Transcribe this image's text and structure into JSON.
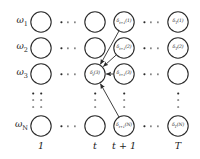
{
  "figure": {
    "type": "trellis-diagram",
    "title": "",
    "stroke_color": "#2a2a2a",
    "background": "#ffffff"
  },
  "row_labels": [
    {
      "id": "w1",
      "text": "ω",
      "sub": "1",
      "y": 22
    },
    {
      "id": "w2",
      "text": "ω",
      "sub": "2",
      "y": 48
    },
    {
      "id": "w3",
      "text": "ω",
      "sub": "3",
      "y": 74
    },
    {
      "id": "wN",
      "text": "ω",
      "sub": "N",
      "y": 126
    }
  ],
  "column_labels": [
    {
      "id": "col-1",
      "text": "1",
      "x": 41
    },
    {
      "id": "col-t",
      "text": "t",
      "x": 95
    },
    {
      "id": "col-t1",
      "text": "t + 1",
      "x": 124
    },
    {
      "id": "col-T",
      "text": "T",
      "x": 178
    }
  ],
  "columns": [
    {
      "id": "col-1",
      "x": 41
    },
    {
      "id": "col-t",
      "x": 95
    },
    {
      "id": "col-t1",
      "x": 124
    },
    {
      "id": "col-T",
      "x": 178
    }
  ],
  "rows": [
    22,
    48,
    74,
    126
  ],
  "node_radius": 10.2,
  "nodes": [
    {
      "id": "n-1-1",
      "col": 0,
      "row": 0,
      "x": 41,
      "y": 22,
      "label": "",
      "sub": ""
    },
    {
      "id": "n-1-2",
      "col": 0,
      "row": 1,
      "x": 41,
      "y": 48,
      "label": "",
      "sub": ""
    },
    {
      "id": "n-1-3",
      "col": 0,
      "row": 2,
      "x": 41,
      "y": 74,
      "label": "",
      "sub": ""
    },
    {
      "id": "n-1-N",
      "col": 0,
      "row": 3,
      "x": 41,
      "y": 126,
      "label": "",
      "sub": ""
    },
    {
      "id": "n-t-1",
      "col": 1,
      "row": 0,
      "x": 95,
      "y": 22,
      "label": "",
      "sub": ""
    },
    {
      "id": "n-t-2",
      "col": 1,
      "row": 1,
      "x": 95,
      "y": 48,
      "label": "",
      "sub": ""
    },
    {
      "id": "n-t-3",
      "col": 1,
      "row": 2,
      "x": 95,
      "y": 74,
      "label": "δ",
      "sub": "t",
      "arg": "(3)"
    },
    {
      "id": "n-t-N",
      "col": 1,
      "row": 3,
      "x": 95,
      "y": 126,
      "label": "",
      "sub": ""
    },
    {
      "id": "n-t1-1",
      "col": 2,
      "row": 0,
      "x": 124,
      "y": 22,
      "label": "δ",
      "sub": "t+1",
      "arg": "(1)"
    },
    {
      "id": "n-t1-2",
      "col": 2,
      "row": 1,
      "x": 124,
      "y": 48,
      "label": "δ",
      "sub": "t+1",
      "arg": "(2)"
    },
    {
      "id": "n-t1-3",
      "col": 2,
      "row": 2,
      "x": 124,
      "y": 74,
      "label": "δ",
      "sub": "t+1",
      "arg": "(3)"
    },
    {
      "id": "n-t1-N",
      "col": 2,
      "row": 3,
      "x": 124,
      "y": 126,
      "label": "δ",
      "sub": "t+1",
      "arg": "(N)"
    },
    {
      "id": "n-T-1",
      "col": 3,
      "row": 0,
      "x": 178,
      "y": 22,
      "label": "δ",
      "sub": "T",
      "arg": "(1)"
    },
    {
      "id": "n-T-2",
      "col": 3,
      "row": 1,
      "x": 178,
      "y": 48,
      "label": "δ",
      "sub": "T",
      "arg": "(2)"
    },
    {
      "id": "n-T-3",
      "col": 3,
      "row": 2,
      "x": 178,
      "y": 74,
      "label": "",
      "sub": ""
    },
    {
      "id": "n-T-N",
      "col": 3,
      "row": 3,
      "x": 178,
      "y": 126,
      "label": "δ",
      "sub": "T",
      "arg": "(N)"
    }
  ],
  "arrows": [
    {
      "id": "arrow-t1-1-to-t-3",
      "from": "n-t1-1",
      "to": "n-t-3",
      "x1": 124,
      "y1": 22,
      "x2": 95,
      "y2": 74
    },
    {
      "id": "arrow-t1-2-to-t-3",
      "from": "n-t1-2",
      "to": "n-t-3",
      "x1": 124,
      "y1": 48,
      "x2": 95,
      "y2": 74
    },
    {
      "id": "arrow-t1-3-to-t-3",
      "from": "n-t1-3",
      "to": "n-t-3",
      "x1": 124,
      "y1": 74,
      "x2": 95,
      "y2": 74
    },
    {
      "id": "arrow-t1-N-to-t-3",
      "from": "n-t1-N",
      "to": "n-t-3",
      "x1": 124,
      "y1": 126,
      "x2": 95,
      "y2": 74
    }
  ],
  "horizontal_ellipses": [
    {
      "id": "hdots-r1-c1",
      "x": 68,
      "y": 22,
      "count": 3
    },
    {
      "id": "hdots-r2-c1",
      "x": 68,
      "y": 48,
      "count": 3
    },
    {
      "id": "hdots-r3-c1",
      "x": 68,
      "y": 74,
      "count": 3
    },
    {
      "id": "hdots-rN-c1",
      "x": 68,
      "y": 126,
      "count": 3
    },
    {
      "id": "hdots-r1-c2",
      "x": 151,
      "y": 22,
      "count": 3
    },
    {
      "id": "hdots-r2-c2",
      "x": 151,
      "y": 48,
      "count": 3
    },
    {
      "id": "hdots-r3-c2",
      "x": 151,
      "y": 74,
      "count": 3
    },
    {
      "id": "hdots-rN-c2",
      "x": 151,
      "y": 126,
      "count": 3
    }
  ],
  "vertical_ellipses": [
    {
      "id": "vdots-col-row",
      "x": 33,
      "y": 100,
      "count": 3
    },
    {
      "id": "vdots-col-1",
      "x": 41,
      "y": 100,
      "count": 3
    },
    {
      "id": "vdots-col-t",
      "x": 95,
      "y": 100,
      "count": 3
    },
    {
      "id": "vdots-col-t1",
      "x": 124,
      "y": 100,
      "count": 3
    },
    {
      "id": "vdots-col-T",
      "x": 178,
      "y": 100,
      "count": 3
    }
  ]
}
